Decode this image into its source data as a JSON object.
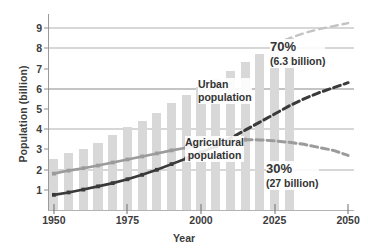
{
  "chart_data": {
    "type": "line",
    "title": "",
    "xlabel": "Year",
    "ylabel": "Population (billion)",
    "xlim": [
      1948,
      2052
    ],
    "ylim": [
      0,
      9.6
    ],
    "grid": true,
    "legend_position": "inline-annotations",
    "x_ticks": [
      1950,
      1975,
      2000,
      2025,
      2050
    ],
    "y_ticks": [
      1,
      2,
      3,
      4,
      5,
      6,
      7,
      8,
      9
    ],
    "gridline_values": [
      2,
      4,
      6,
      8,
      9
    ],
    "bars": {
      "name": "Total population",
      "color": "#d8d8d8",
      "x": [
        1950,
        1955,
        1960,
        1965,
        1970,
        1975,
        1980,
        1985,
        1990,
        1995,
        2000,
        2005,
        2010,
        2015,
        2020,
        2025,
        2030
      ],
      "values": [
        2.5,
        2.8,
        3.0,
        3.3,
        3.7,
        4.1,
        4.4,
        4.8,
        5.3,
        5.7,
        6.1,
        6.5,
        6.9,
        7.3,
        7.7,
        8.1,
        8.5
      ]
    },
    "series": [
      {
        "name": "Urban population",
        "color": "#3a3a3a",
        "style": "solid-then-dashed",
        "dash_starts_at": 2005,
        "x": [
          1950,
          1955,
          1960,
          1965,
          1970,
          1975,
          1980,
          1985,
          1990,
          1995,
          2000,
          2005,
          2010,
          2015,
          2020,
          2025,
          2030,
          2035,
          2040,
          2045,
          2050
        ],
        "values": [
          0.75,
          0.87,
          1.01,
          1.17,
          1.33,
          1.52,
          1.74,
          1.99,
          2.27,
          2.55,
          2.85,
          3.15,
          3.55,
          3.95,
          4.35,
          4.75,
          5.15,
          5.5,
          5.8,
          6.05,
          6.3
        ]
      },
      {
        "name": "Agricultural population",
        "color": "#9b9b9b",
        "style": "solid-then-dashed",
        "dash_starts_at": 2015,
        "x": [
          1950,
          1955,
          1960,
          1965,
          1970,
          1975,
          1980,
          1985,
          1990,
          1995,
          2000,
          2005,
          2010,
          2015,
          2020,
          2025,
          2030,
          2035,
          2040,
          2045,
          2050
        ],
        "values": [
          1.8,
          1.95,
          2.07,
          2.2,
          2.35,
          2.5,
          2.65,
          2.8,
          2.95,
          3.08,
          3.2,
          3.33,
          3.42,
          3.48,
          3.47,
          3.42,
          3.35,
          3.25,
          3.1,
          2.95,
          2.7
        ]
      },
      {
        "name": "Total population projection",
        "color": "#c3c3c3",
        "style": "dashed",
        "x": [
          2025,
          2030,
          2035,
          2040,
          2045,
          2050
        ],
        "values": [
          8.1,
          8.5,
          8.75,
          8.95,
          9.1,
          9.25
        ]
      }
    ],
    "annotations": [
      {
        "id": "urban-label",
        "text": "Urban",
        "text2": "population"
      },
      {
        "id": "agricultural-label",
        "text": "Agricultural",
        "text2": "population"
      },
      {
        "id": "urban-share",
        "text": "70%",
        "text2": "(6.3 billion)"
      },
      {
        "id": "agricultural-share",
        "text": "30%",
        "text2": "(27 billion)"
      }
    ]
  },
  "axis": {
    "y_title": "Population (billion)",
    "x_title": "Year",
    "y_tick_labels": [
      "1",
      "2",
      "3",
      "4",
      "5",
      "6",
      "7",
      "8",
      "9"
    ],
    "x_tick_labels": [
      "1950",
      "1975",
      "2000",
      "2025",
      "2050"
    ]
  },
  "labels": {
    "urban_line1": "Urban",
    "urban_line2": "population",
    "agricultural_line1": "Agricultural",
    "agricultural_line2": "population",
    "urban_pct": "70%",
    "urban_pct_sub": "(6.3 billion)",
    "agricultural_pct": "30%",
    "agricultural_pct_sub": "(27 billion)"
  },
  "colors": {
    "bar": "#d8d8d8",
    "urban_line": "#3a3a3a",
    "agricultural_line": "#9b9b9b",
    "projection_line": "#c3c3c3",
    "grid": "#b0b0b0",
    "grid_strong": "#8a8a8a",
    "text": "#3c3c3c"
  }
}
